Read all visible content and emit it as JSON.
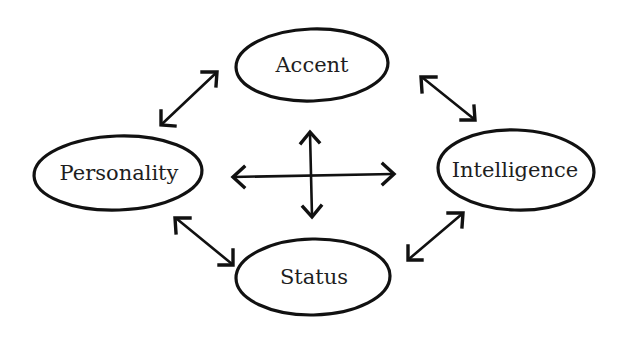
{
  "diagram": {
    "type": "concept-relationship",
    "nodes": {
      "accent": {
        "label": "Accent"
      },
      "personality": {
        "label": "Personality"
      },
      "intelligence": {
        "label": "Intelligence"
      },
      "status": {
        "label": "Status"
      }
    },
    "edges": [
      {
        "from": "personality",
        "to": "accent",
        "direction": "bidirectional"
      },
      {
        "from": "accent",
        "to": "intelligence",
        "direction": "bidirectional"
      },
      {
        "from": "personality",
        "to": "status",
        "direction": "bidirectional"
      },
      {
        "from": "status",
        "to": "intelligence",
        "direction": "bidirectional"
      }
    ],
    "center_symbol": "four-way-cross-arrow",
    "colors": {
      "stroke": "#111111",
      "text": "#1e1e1e",
      "background": "#ffffff"
    }
  }
}
